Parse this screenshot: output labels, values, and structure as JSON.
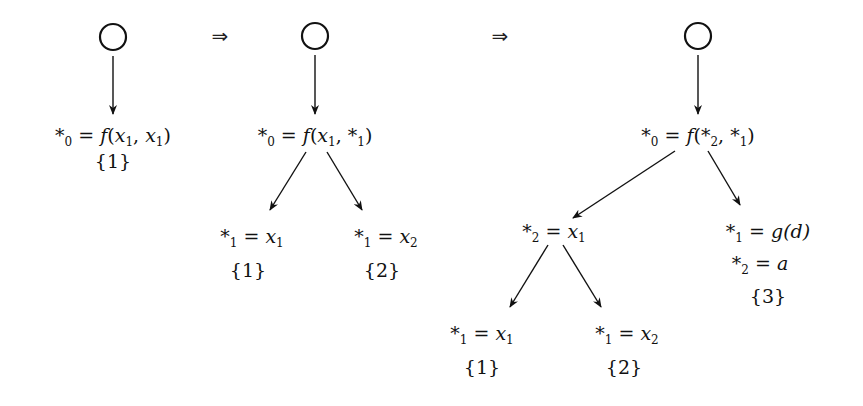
{
  "colors": {
    "ink": "#111111",
    "background": "#ffffff"
  },
  "transitions": [
    {
      "symbol": "⇒",
      "x": 220,
      "y": 26
    },
    {
      "symbol": "⇒",
      "x": 500,
      "y": 26
    }
  ],
  "trees": [
    {
      "root_circle": {
        "x": 113,
        "y": 37,
        "r": 13
      },
      "root_edge": {
        "x1": 113,
        "y1": 56,
        "x2": 113,
        "y2": 114
      },
      "root": {
        "star_index": "0",
        "rhs": "f(x1, x1)",
        "parts": [
          "*",
          "0",
          " = ",
          "f",
          "(",
          "x",
          "1",
          ", ",
          "x",
          "1",
          ")"
        ],
        "x": 113,
        "y": 124,
        "set": "{1}",
        "set_y": 150
      }
    },
    {
      "root_circle": {
        "x": 315,
        "y": 36,
        "r": 13
      },
      "root_edge": {
        "x1": 315,
        "y1": 55,
        "x2": 315,
        "y2": 114
      },
      "root": {
        "star_index": "0",
        "rhs": "f(x1, *1)",
        "parts": [
          "*",
          "0",
          " = ",
          "f",
          "(",
          "x",
          "1",
          ", ",
          "*",
          "1",
          ")"
        ],
        "x": 315,
        "y": 124
      },
      "edges": [
        {
          "x1": 306,
          "y1": 152,
          "x2": 270,
          "y2": 210
        },
        {
          "x1": 327,
          "y1": 152,
          "x2": 362,
          "y2": 210
        }
      ],
      "children": [
        {
          "lhs_star": "1",
          "rhs_var": "x",
          "rhs_sub": "1",
          "x": 252,
          "y": 225,
          "set": "{1}",
          "set_y": 259
        },
        {
          "lhs_star": "1",
          "rhs_var": "x",
          "rhs_sub": "2",
          "x": 386,
          "y": 225,
          "set": "{2}",
          "set_y": 259
        }
      ]
    },
    {
      "root_circle": {
        "x": 698,
        "y": 36,
        "r": 13
      },
      "root_edge": {
        "x1": 698,
        "y1": 55,
        "x2": 698,
        "y2": 114
      },
      "root": {
        "star_index": "0",
        "rhs": "f(*2, *1)",
        "parts": [
          "*",
          "0",
          " = ",
          "f",
          "(",
          "*",
          "2",
          ", ",
          "*",
          "1",
          ")"
        ],
        "x": 698,
        "y": 124
      },
      "edges": [
        {
          "x1": 675,
          "y1": 151,
          "x2": 573,
          "y2": 218
        },
        {
          "x1": 708,
          "y1": 151,
          "x2": 740,
          "y2": 205
        }
      ],
      "children": [
        {
          "lhs_star": "2",
          "rhs_var": "x",
          "rhs_sub": "1",
          "x": 554,
          "y": 220
        },
        {
          "lines": [
            {
              "lhs_star": "1",
              "rhs": "g(d)"
            },
            {
              "lhs_star": "2",
              "rhs": "a"
            }
          ],
          "x": 768,
          "y": 220,
          "line2_y": 252,
          "set": "{3}",
          "set_y": 285
        }
      ],
      "grandchild_edges": [
        {
          "x1": 548,
          "y1": 245,
          "x2": 510,
          "y2": 307
        },
        {
          "x1": 563,
          "y1": 245,
          "x2": 601,
          "y2": 307
        }
      ],
      "grandchildren": [
        {
          "lhs_star": "1",
          "rhs_var": "x",
          "rhs_sub": "1",
          "x": 482,
          "y": 322,
          "set": "{1}",
          "set_y": 356
        },
        {
          "lhs_star": "1",
          "rhs_var": "x",
          "rhs_sub": "2",
          "x": 627,
          "y": 322,
          "set": "{2}",
          "set_y": 356
        }
      ]
    }
  ]
}
